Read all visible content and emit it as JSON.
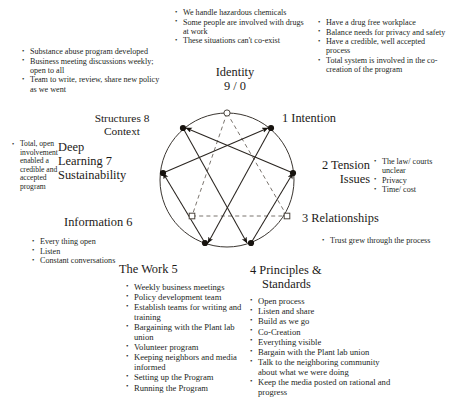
{
  "diagram": {
    "title_center": "Identity",
    "title_center_sub": "9 / 0",
    "nodes": {
      "n9": "9 / 0",
      "n1": "1 Intention",
      "n2_line1": "2 Tension",
      "n2_line2": "Issues",
      "n3": "3 Relationships",
      "n4_line1": "4 Principles &",
      "n4_line2": "Standards",
      "n5": "The Work 5",
      "n6": "Information 6",
      "n7_line1": "Deep",
      "n7_line2": "Learning 7",
      "n7_line3": "Sustainability",
      "n8_line1": "Structures 8",
      "n8_line2": "Context"
    }
  },
  "sections": {
    "top_center": {
      "bullets": [
        "We handle hazardous chemicals",
        "Some people are involved with drugs at work",
        "These situations can't co-exist"
      ]
    },
    "top_left": {
      "bullets": [
        "Substance abuse program developed",
        "Business meeting discussions weekly; open to all",
        "Team to write, review,  share new policy as we went"
      ]
    },
    "top_right": {
      "bullets": [
        "Have a drug free workplace",
        "Balance needs for privacy and safety",
        "Have a credible, well accepted process",
        "Total system is involved in the co-creation of the program"
      ]
    },
    "left_mid": {
      "bullets": [
        "Total, open involvement enabled a credible and accepted program"
      ]
    },
    "right_mid": {
      "bullets": [
        "The law/ courts unclear",
        "Privacy",
        "Time/ cost"
      ]
    },
    "left_lower": {
      "bullets": [
        "Every thing open",
        "Listen",
        "Constant conversations"
      ]
    },
    "right_lower": {
      "bullets": [
        "Trust grew through the process"
      ]
    },
    "bottom_left": {
      "bullets": [
        "Weekly business meetings",
        "Policy development team",
        "Establish teams for writing and training",
        "Bargaining  with the Plant lab union",
        "Volunteer program",
        "Keeping neighbors and media informed",
        "Setting up the Program",
        "Running the Program"
      ]
    },
    "bottom_right": {
      "bullets": [
        "Open process",
        "Listen and share",
        "Build as we go",
        "Co-Creation",
        "Everything visible",
        "Bargain with the Plant lab union",
        "Talk to the neighboring community about what we were doing",
        "Keep the media posted on rational and progress"
      ]
    }
  },
  "colors": {
    "ink": "#231f1c",
    "line": "#3a3530",
    "node_fill": "#17130f",
    "node_hollow": "#ffffff"
  }
}
